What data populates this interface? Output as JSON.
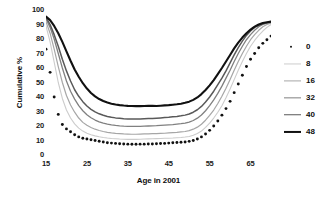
{
  "chart_data": {
    "type": "line",
    "title": "",
    "xlabel": "Age in 2001",
    "ylabel": "Cumulative %",
    "xlim": [
      15,
      70
    ],
    "ylim": [
      0,
      100
    ],
    "grid": false,
    "legend_position": "right",
    "xticks": [
      15,
      25,
      35,
      45,
      55,
      65
    ],
    "yticks": [
      0,
      10,
      20,
      30,
      40,
      50,
      60,
      70,
      80,
      90,
      100
    ],
    "x": [
      15,
      16,
      17,
      18,
      19,
      20,
      21,
      22,
      23,
      24,
      25,
      26,
      27,
      28,
      29,
      30,
      31,
      32,
      33,
      34,
      35,
      36,
      37,
      38,
      39,
      40,
      41,
      42,
      43,
      44,
      45,
      46,
      47,
      48,
      49,
      50,
      51,
      52,
      53,
      54,
      55,
      56,
      57,
      58,
      59,
      60,
      61,
      62,
      63,
      64,
      65,
      66,
      67,
      68,
      69,
      70
    ],
    "series": [
      {
        "name": "0",
        "style": "dotted",
        "color": "#111111",
        "values": [
          73,
          57,
          40,
          28,
          21,
          18,
          16,
          14,
          12.5,
          11.5,
          11,
          10.5,
          10,
          9.5,
          9,
          8.5,
          8.2,
          8,
          7.8,
          7.6,
          7.5,
          7.4,
          7.4,
          7.5,
          7.5,
          7.6,
          7.6,
          7.8,
          7.9,
          8,
          8.2,
          8.4,
          8.6,
          8.8,
          9,
          9.4,
          10,
          11,
          12.5,
          14.5,
          17,
          20,
          23.5,
          27.5,
          32,
          37,
          43,
          49,
          55,
          61,
          66,
          70,
          74,
          77,
          79.5,
          82
        ]
      },
      {
        "name": "8",
        "style": "solid",
        "color": "#cccccc",
        "width": 1.1,
        "values": [
          89,
          78,
          64,
          50,
          39,
          31,
          25.5,
          21.5,
          18.5,
          16.5,
          15,
          14,
          13.2,
          12.6,
          12.1,
          11.7,
          11.4,
          11.2,
          11,
          10.9,
          10.8,
          10.8,
          10.8,
          10.9,
          11,
          11.1,
          11.2,
          11.3,
          11.4,
          11.5,
          11.6,
          11.7,
          11.9,
          12.1,
          12.4,
          12.8,
          13.6,
          14.8,
          16.5,
          19,
          22,
          25.5,
          29.5,
          34,
          39.5,
          45.5,
          52,
          58.5,
          64.5,
          70,
          75,
          79,
          82.5,
          85.5,
          88,
          90
        ]
      },
      {
        "name": "16",
        "style": "solid",
        "color": "#a6a6a6",
        "width": 1.2,
        "values": [
          92,
          84,
          73,
          61,
          50,
          41,
          34.5,
          29.5,
          25.5,
          22.5,
          20.5,
          19,
          17.8,
          16.9,
          16.2,
          15.6,
          15.2,
          14.9,
          14.7,
          14.5,
          14.4,
          14.3,
          14.3,
          14.4,
          14.5,
          14.6,
          14.7,
          14.8,
          14.9,
          15,
          15.2,
          15.4,
          15.6,
          15.9,
          16.2,
          16.8,
          17.8,
          19.2,
          21.2,
          24,
          27.3,
          31,
          35.5,
          40.5,
          46,
          52,
          58.5,
          64.5,
          70,
          75,
          79.5,
          83,
          86,
          88.5,
          90,
          91
        ]
      },
      {
        "name": "32",
        "style": "solid",
        "color": "#808080",
        "width": 1.3,
        "values": [
          94,
          88,
          80,
          70,
          60,
          51,
          44,
          38.5,
          34,
          30.5,
          27.8,
          25.7,
          24.1,
          22.9,
          22,
          21.3,
          20.8,
          20.4,
          20.1,
          19.9,
          19.8,
          19.7,
          19.7,
          19.8,
          19.9,
          20,
          20.1,
          20.2,
          20.4,
          20.6,
          20.8,
          21,
          21.3,
          21.6,
          22,
          22.7,
          23.8,
          25.4,
          27.6,
          30.5,
          34,
          38,
          42.5,
          47.5,
          53,
          58.5,
          64.5,
          70,
          75,
          79.5,
          83,
          86,
          88.5,
          90,
          91,
          91.5
        ]
      },
      {
        "name": "40",
        "style": "solid",
        "color": "#595959",
        "width": 1.5,
        "values": [
          95,
          90,
          83,
          75,
          66,
          58,
          51,
          45,
          40.5,
          36.8,
          33.8,
          31.5,
          29.7,
          28.4,
          27.4,
          26.6,
          26,
          25.6,
          25.3,
          25,
          24.9,
          24.8,
          24.8,
          24.9,
          25,
          25.1,
          25.2,
          25.4,
          25.6,
          25.8,
          26,
          26.3,
          26.6,
          27,
          27.5,
          28.3,
          29.5,
          31.2,
          33.5,
          36.5,
          40,
          44,
          48.5,
          53,
          58,
          63.5,
          69,
          74,
          78.5,
          82.5,
          85.5,
          88,
          89.5,
          90.5,
          91.2,
          91.8
        ]
      },
      {
        "name": "48",
        "style": "solid",
        "color": "#111111",
        "width": 2.1,
        "values": [
          95.5,
          93,
          89,
          84,
          78,
          71.5,
          65,
          59,
          54,
          49.5,
          45.8,
          42.8,
          40.4,
          38.6,
          37.2,
          36.2,
          35.4,
          34.8,
          34.4,
          34.1,
          33.9,
          33.8,
          33.7,
          33.7,
          33.8,
          33.9,
          34,
          33.8,
          34,
          34.2,
          34.4,
          34.7,
          35,
          35.4,
          36,
          36.8,
          38,
          39.7,
          42,
          44.8,
          48,
          51.7,
          55.8,
          60,
          64.5,
          69,
          73.5,
          77.5,
          81,
          84,
          86.5,
          88.5,
          90,
          91,
          91.6,
          92
        ]
      }
    ]
  },
  "legend": {
    "items": [
      {
        "label": "0"
      },
      {
        "label": "8"
      },
      {
        "label": "16"
      },
      {
        "label": "32"
      },
      {
        "label": "40"
      },
      {
        "label": "48"
      }
    ]
  }
}
